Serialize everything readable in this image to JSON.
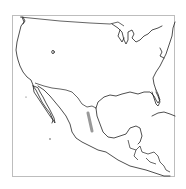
{
  "map": {
    "region": "North America (United States, Mexico, Central America)",
    "frame_border_color": "#bdbdbd",
    "coastline_color": "#222222",
    "range": {
      "label": "distribution range",
      "color": "#999999",
      "location": "central Mexico (Sierra Madre Oriental)"
    }
  }
}
